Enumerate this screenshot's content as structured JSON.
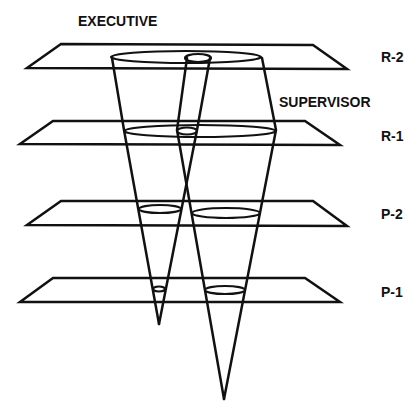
{
  "diagram": {
    "cone_labels": {
      "executive": "EXECUTIVE",
      "supervisor": "SUPERVISOR"
    },
    "planes": [
      {
        "id": "R-2",
        "label": "R-2"
      },
      {
        "id": "R-1",
        "label": "R-1"
      },
      {
        "id": "P-2",
        "label": "P-2"
      },
      {
        "id": "P-1",
        "label": "P-1"
      }
    ],
    "colors": {
      "stroke": "#111111",
      "background": "#ffffff"
    }
  }
}
